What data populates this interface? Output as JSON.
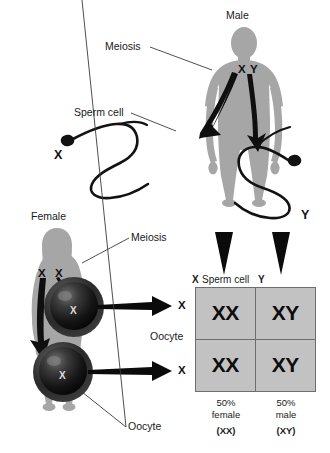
{
  "diagram": {
    "background_color": "#ffffff",
    "silhouette_color": "#a6a6a6",
    "ink_color": "#111111",
    "square_fill": "#c2c2c2",
    "square_border": "#6e6e6e"
  },
  "labels": {
    "male": "Male",
    "female": "Female",
    "meiosis_male": "Meiosis",
    "meiosis_female": "Meiosis",
    "sperm_cell": "Sperm cell",
    "oocyte_upper": "Oocyte",
    "oocyte_lower": "Oocyte",
    "oocyte_side": "Oocyte"
  },
  "male_alleles": {
    "x": "X",
    "y": "Y"
  },
  "female_alleles": {
    "x1": "X",
    "x2": "X"
  },
  "sperm_labels": {
    "x": "X",
    "y": "Y"
  },
  "oocyte_labels": {
    "upper": "X",
    "lower": "X"
  },
  "oocyte_nucleus": {
    "upper": "X",
    "lower": "X"
  },
  "punnett": {
    "top_header_left": "X",
    "top_header_center": "Sperm cell",
    "top_header_right": "Y",
    "row_labels": [
      "X",
      "X"
    ],
    "side_label": "Oocyte",
    "cells": [
      "XX",
      "XY",
      "XX",
      "XY"
    ],
    "footers": [
      {
        "percent": "50%",
        "sex": "female",
        "genotype": "(XX)"
      },
      {
        "percent": "50%",
        "sex": "male",
        "genotype": "(XY)"
      }
    ]
  }
}
